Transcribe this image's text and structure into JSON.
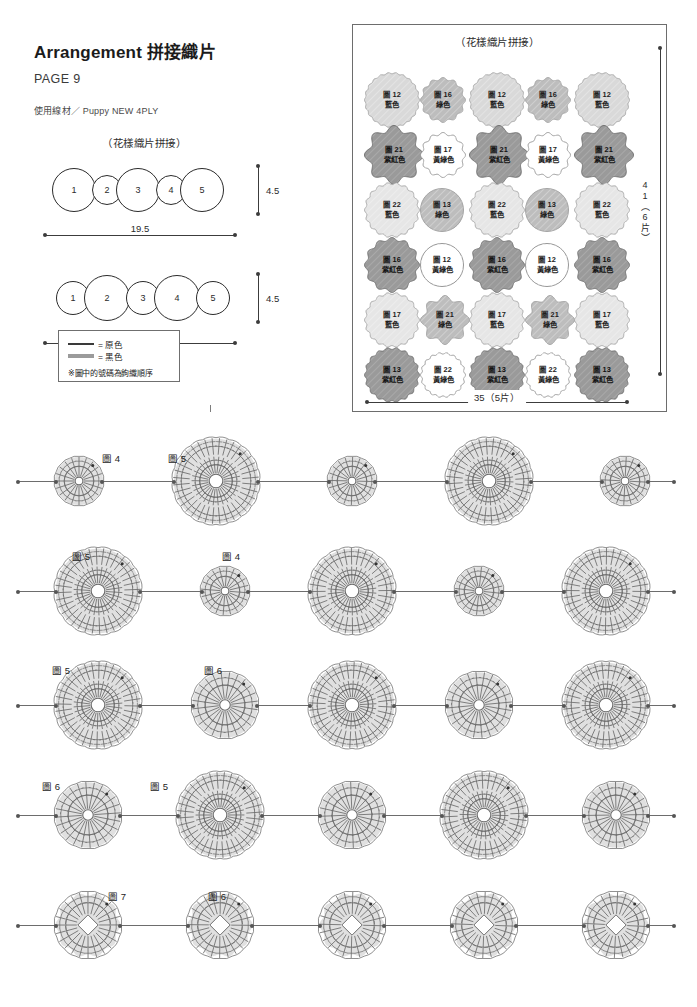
{
  "header": {
    "title": "Arrangement 拼接織片",
    "page_no": "PAGE 9",
    "yarn": "使用線材／ Puppy NEW 4PLY"
  },
  "left_assembly": {
    "caption": "（花樣織片拼接）",
    "rows": [
      {
        "numbers": [
          "1",
          "2",
          "3",
          "4",
          "5"
        ],
        "width_label": "19.5",
        "height_label": "4.5"
      },
      {
        "numbers": [
          "1",
          "2",
          "3",
          "4",
          "5"
        ],
        "width_label": "18",
        "height_label": "4.5"
      }
    ]
  },
  "legend": {
    "items": [
      {
        "swatch": "thin-line",
        "label": "= 原色"
      },
      {
        "swatch": "thick-line",
        "label": "= 黑色"
      }
    ],
    "note": "※圖中的號碼為鉤織順序"
  },
  "grid_panel": {
    "caption": "（花樣織片拼接）",
    "width_label": "35（5片）",
    "height_label": "41（6片）",
    "rows": [
      [
        {
          "num": "圖 12",
          "color": "藍色",
          "shade": "light",
          "shape": "scallop-round"
        },
        {
          "num": "圖 16",
          "color": "綠色",
          "shade": "mid",
          "shape": "scallop-small"
        },
        {
          "num": "圖 12",
          "color": "藍色",
          "shade": "light",
          "shape": "scallop-round"
        },
        {
          "num": "圖 16",
          "color": "綠色",
          "shade": "mid",
          "shape": "scallop-small"
        },
        {
          "num": "圖 12",
          "color": "藍色",
          "shade": "light",
          "shape": "scallop-round"
        }
      ],
      [
        {
          "num": "圖 21",
          "color": "紫紅色",
          "shade": "dark",
          "shape": "petal"
        },
        {
          "num": "圖 17",
          "color": "黃綠色",
          "shade": "white",
          "shape": "scallop-small"
        },
        {
          "num": "圖 21",
          "color": "紫紅色",
          "shade": "dark",
          "shape": "petal"
        },
        {
          "num": "圖 17",
          "color": "黃綠色",
          "shade": "white",
          "shape": "scallop-small"
        },
        {
          "num": "圖 21",
          "color": "紫紅色",
          "shade": "dark",
          "shape": "petal"
        }
      ],
      [
        {
          "num": "圖 22",
          "color": "藍色",
          "shade": "pale",
          "shape": "scallop-fine"
        },
        {
          "num": "圖 13",
          "color": "綠色",
          "shade": "mid",
          "shape": "round"
        },
        {
          "num": "圖 22",
          "color": "藍色",
          "shade": "pale",
          "shape": "scallop-fine"
        },
        {
          "num": "圖 13",
          "color": "綠色",
          "shade": "mid",
          "shape": "round"
        },
        {
          "num": "圖 22",
          "color": "藍色",
          "shade": "pale",
          "shape": "scallop-fine"
        }
      ],
      [
        {
          "num": "圖 16",
          "color": "紫紅色",
          "shade": "dark",
          "shape": "scallop-small"
        },
        {
          "num": "圖 12",
          "color": "黃綠色",
          "shade": "white",
          "shape": "round"
        },
        {
          "num": "圖 16",
          "color": "紫紅色",
          "shade": "dark",
          "shape": "scallop-small"
        },
        {
          "num": "圖 12",
          "color": "黃綠色",
          "shade": "white",
          "shape": "round"
        },
        {
          "num": "圖 16",
          "color": "紫紅色",
          "shade": "dark",
          "shape": "scallop-small"
        }
      ],
      [
        {
          "num": "圖 17",
          "color": "藍色",
          "shade": "pale",
          "shape": "scallop-fine"
        },
        {
          "num": "圖 21",
          "color": "綠色",
          "shade": "mid",
          "shape": "petal"
        },
        {
          "num": "圖 17",
          "color": "藍色",
          "shade": "pale",
          "shape": "scallop-fine"
        },
        {
          "num": "圖 21",
          "color": "綠色",
          "shade": "mid",
          "shape": "petal"
        },
        {
          "num": "圖 17",
          "color": "藍色",
          "shade": "pale",
          "shape": "scallop-fine"
        }
      ],
      [
        {
          "num": "圖 13",
          "color": "紫紅色",
          "shade": "dark",
          "shape": "scallop-fine"
        },
        {
          "num": "圖 22",
          "color": "黃綠色",
          "shade": "white",
          "shape": "scallop-fine"
        },
        {
          "num": "圖 13",
          "color": "紫紅色",
          "shade": "dark",
          "shape": "scallop-fine"
        },
        {
          "num": "圖 22",
          "color": "黃綠色",
          "shade": "white",
          "shape": "scallop-fine"
        },
        {
          "num": "圖 13",
          "color": "紫紅色",
          "shade": "dark",
          "shape": "scallop-fine"
        }
      ]
    ]
  },
  "charts": {
    "rows": [
      {
        "labels": [
          "圖 4",
          "圖 5"
        ],
        "sizes": [
          54,
          92,
          54,
          92,
          54
        ],
        "style": "dc-round"
      },
      {
        "labels": [
          "圖 5",
          "圖 4"
        ],
        "sizes": [
          92,
          54,
          92,
          54,
          92
        ],
        "style": "dc-round"
      },
      {
        "labels": [
          "圖 5",
          "圖 6"
        ],
        "sizes": [
          92,
          72,
          92,
          72,
          92
        ],
        "style": "mixed"
      },
      {
        "labels": [
          "圖 6",
          "圖 5"
        ],
        "sizes": [
          72,
          92,
          72,
          92,
          72
        ],
        "style": "mixed"
      },
      {
        "labels": [
          "圖 7",
          "圖 6"
        ],
        "sizes": [
          72,
          72,
          72,
          72,
          72
        ],
        "style": "picot"
      }
    ]
  },
  "colors": {
    "ink": "#231f20",
    "rule": "#6d6d6d",
    "motif_light": "#d9d9d9",
    "motif_mid": "#bdbdbd",
    "motif_dark": "#9a9a9a",
    "motif_pale": "#e6e6e6",
    "motif_white": "#ffffff",
    "chart_fill": "#e0e0e0",
    "chart_line": "#6b6b6b"
  }
}
